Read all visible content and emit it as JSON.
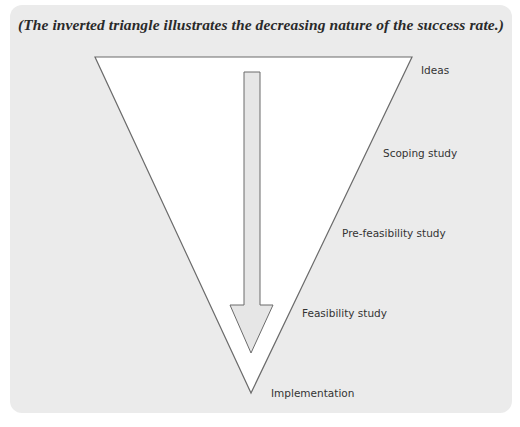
{
  "caption": "(The inverted triangle illustrates the decreasing nature of the success rate.)",
  "colors": {
    "panel_background": "#ebebeb",
    "triangle_fill": "#ffffff",
    "outline": "#6b6b6b",
    "arrow_fill": "#e6e6e6",
    "text": "#333333"
  },
  "triangle": {
    "top_left": [
      95,
      57
    ],
    "top_right": [
      412,
      57
    ],
    "tip": [
      251,
      393
    ]
  },
  "arrow": {
    "shaft_left": 244,
    "shaft_right": 260,
    "shaft_top": 72,
    "shaft_bottom": 305,
    "head_left": 230,
    "head_right": 273,
    "tip": [
      251,
      353
    ],
    "direction": "down"
  },
  "stages": [
    {
      "label": "Ideas",
      "x": 421,
      "y": 64
    },
    {
      "label": "Scoping study",
      "x": 383,
      "y": 147
    },
    {
      "label": "Pre-feasibility study",
      "x": 342,
      "y": 227
    },
    {
      "label": "Feasibility study",
      "x": 302,
      "y": 307
    },
    {
      "label": "Implementation",
      "x": 271,
      "y": 387
    }
  ]
}
